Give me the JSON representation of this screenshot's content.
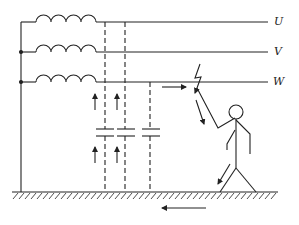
{
  "diagram": {
    "phases": [
      {
        "label": "U",
        "y": 22
      },
      {
        "label": "V",
        "y": 52
      },
      {
        "label": "W",
        "y": 82
      }
    ],
    "colors": {
      "stroke": "#222222",
      "background": "#ffffff"
    },
    "elements": [
      "generator-windings",
      "phase-lines",
      "distributed-capacitance",
      "ground-hatching",
      "person",
      "current-arrows",
      "contact-spark"
    ]
  }
}
